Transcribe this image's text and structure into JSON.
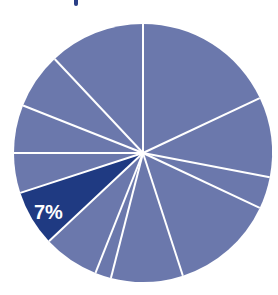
{
  "chart_data": {
    "type": "pie",
    "title": "",
    "start_angle_deg": 0,
    "direction": "clockwise",
    "center": [
      143,
      153
    ],
    "radius": 129,
    "colors": {
      "default_slice": "#6b78ac",
      "highlight_slice": "#1f3a82",
      "divider": "#ffffff",
      "label": "#ffffff"
    },
    "values": [
      18,
      10,
      4,
      13,
      9,
      2,
      7,
      7,
      5,
      6,
      7,
      12
    ],
    "highlight_index": 7,
    "labels": [
      "",
      "",
      "",
      "",
      "",
      "",
      "",
      "7%",
      "",
      "",
      "",
      ""
    ],
    "annotations": [
      {
        "text": "7%",
        "slice_index": 7
      }
    ],
    "legend": null,
    "grid": false
  }
}
